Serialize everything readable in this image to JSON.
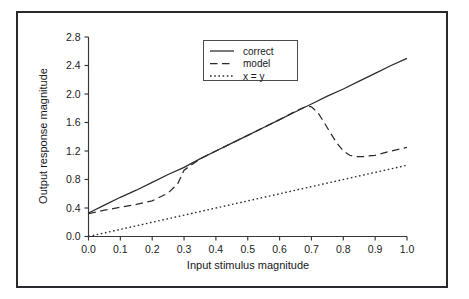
{
  "chart_data": {
    "type": "line",
    "title": "",
    "xlabel": "Input stimulus magnitude",
    "ylabel": "Output response magnitude",
    "xlim": [
      0.0,
      1.0
    ],
    "ylim": [
      0.0,
      2.8
    ],
    "xticks": [
      "0.0",
      "0.1",
      "0.2",
      "0.3",
      "0.4",
      "0.5",
      "0.6",
      "0.7",
      "0.8",
      "0.9",
      "1.0"
    ],
    "yticks": [
      "0.0",
      "0.4",
      "0.8",
      "1.2",
      "1.6",
      "2.0",
      "2.4",
      "2.8"
    ],
    "xtick_values": [
      0.0,
      0.1,
      0.2,
      0.3,
      0.4,
      0.5,
      0.6,
      0.7,
      0.8,
      0.9,
      1.0
    ],
    "ytick_values": [
      0.0,
      0.4,
      0.8,
      1.2,
      1.6,
      2.0,
      2.4,
      2.8
    ],
    "grid": false,
    "legend_position": "upper-center",
    "series": [
      {
        "name": "correct",
        "style": "solid",
        "color": "#2b2b30",
        "x": [
          0.0,
          0.05,
          0.1,
          0.15,
          0.2,
          0.25,
          0.3,
          0.35,
          0.4,
          0.45,
          0.5,
          0.55,
          0.6,
          0.65,
          0.7,
          0.75,
          0.8,
          0.85,
          0.9,
          0.95,
          1.0
        ],
        "y": [
          0.33,
          0.44,
          0.55,
          0.65,
          0.76,
          0.87,
          0.97,
          1.09,
          1.2,
          1.31,
          1.42,
          1.53,
          1.64,
          1.75,
          1.86,
          1.97,
          2.07,
          2.18,
          2.29,
          2.4,
          2.5
        ]
      },
      {
        "name": "model",
        "style": "dashed",
        "color": "#2b2b30",
        "x": [
          0.0,
          0.05,
          0.1,
          0.15,
          0.2,
          0.25,
          0.28,
          0.3,
          0.35,
          0.4,
          0.45,
          0.5,
          0.55,
          0.6,
          0.65,
          0.68,
          0.69,
          0.7,
          0.72,
          0.74,
          0.76,
          0.78,
          0.8,
          0.82,
          0.84,
          0.86,
          0.88,
          0.9,
          0.95,
          1.0
        ],
        "y": [
          0.32,
          0.37,
          0.41,
          0.45,
          0.5,
          0.61,
          0.74,
          0.93,
          1.09,
          1.2,
          1.31,
          1.42,
          1.53,
          1.64,
          1.76,
          1.82,
          1.83,
          1.82,
          1.74,
          1.6,
          1.45,
          1.31,
          1.2,
          1.14,
          1.12,
          1.12,
          1.13,
          1.14,
          1.2,
          1.25
        ]
      },
      {
        "name": "x = y",
        "style": "dotted",
        "color": "#2b2b30",
        "x": [
          0.0,
          1.0
        ],
        "y": [
          0.0,
          1.0
        ]
      }
    ],
    "legend_entries": [
      {
        "label": "correct",
        "style": "solid"
      },
      {
        "label": "model",
        "style": "dashed"
      },
      {
        "label": "x = y",
        "style": "dotted"
      }
    ]
  }
}
